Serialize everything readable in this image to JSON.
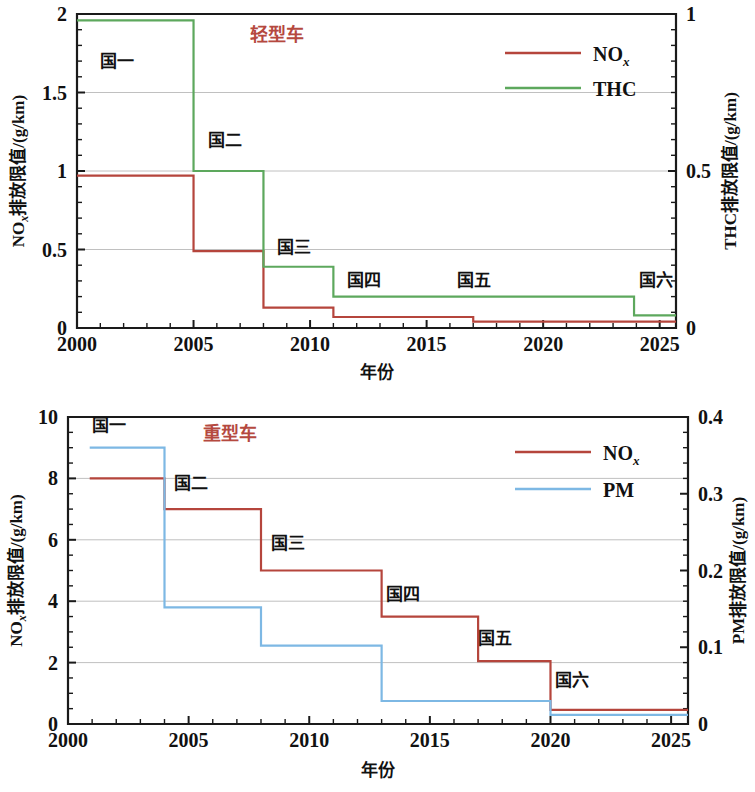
{
  "figure": {
    "panels": [
      {
        "id": "light-duty",
        "panel_title": "轻型车",
        "panel_title_color": "#b5493f",
        "x_axis_title": "年份",
        "y_left_title_main": "NO",
        "y_left_title_sub": "x",
        "y_left_title_rest": "排放限值/(g/km)",
        "y_right_title": "THC排放限值/(g/km)",
        "x_ticks": [
          "2000",
          "2005",
          "2010",
          "2015",
          "2020",
          "2025"
        ],
        "y_left_ticks": [
          "0",
          "0.5",
          "1",
          "1.5",
          "2"
        ],
        "y_right_ticks": [
          "0",
          "0.5",
          "1"
        ],
        "stage_labels": [
          {
            "text": "国一",
            "x": 2001.0,
            "y": 1.66
          },
          {
            "text": "国二",
            "x": 2005.6,
            "y": 1.16
          },
          {
            "text": "国三",
            "x": 2008.6,
            "y": 0.48
          },
          {
            "text": "国四",
            "x": 2011.6,
            "y": 0.27
          },
          {
            "text": "国五",
            "x": 2016.3,
            "y": 0.27
          },
          {
            "text": "国六",
            "x": 2024.1,
            "y": 0.27
          }
        ],
        "legend": [
          {
            "label": "NO",
            "sub": "x",
            "color": "#b5453c",
            "name": "nox"
          },
          {
            "label": "THC",
            "sub": "",
            "color": "#5da85d",
            "name": "thc"
          }
        ]
      },
      {
        "id": "heavy-duty",
        "panel_title": "重型车",
        "panel_title_color": "#b5493f",
        "x_axis_title": "年份",
        "y_left_title_main": "NO",
        "y_left_title_sub": "x",
        "y_left_title_rest": "排放限值/(g/km)",
        "y_right_title": "PM排放限值/(g/km)",
        "x_ticks": [
          "2000",
          "2005",
          "2010",
          "2015",
          "2020",
          "2025"
        ],
        "y_left_ticks": [
          "0",
          "2",
          "4",
          "6",
          "8",
          "10"
        ],
        "y_right_ticks": [
          "0",
          "0.1",
          "0.2",
          "0.3",
          "0.4"
        ],
        "stage_labels": [
          {
            "text": "国一",
            "x": 2001.0,
            "y": 9.55
          },
          {
            "text": "国二",
            "x": 2004.4,
            "y": 7.65
          },
          {
            "text": "国三",
            "x": 2008.4,
            "y": 5.7
          },
          {
            "text": "国四",
            "x": 2013.2,
            "y": 4.05
          },
          {
            "text": "国五",
            "x": 2017.0,
            "y": 2.6
          },
          {
            "text": "国六",
            "x": 2020.2,
            "y": 1.25
          }
        ],
        "legend": [
          {
            "label": "NO",
            "sub": "x",
            "color": "#b5453c",
            "name": "nox"
          },
          {
            "label": "PM",
            "sub": "",
            "color": "#7db8e4",
            "name": "pm"
          }
        ]
      }
    ]
  },
  "chart_data": [
    {
      "type": "line",
      "title": "轻型车",
      "subtitle": "Light-duty vehicle emission limits by China national stage",
      "xlabel": "年份",
      "ylabel": "NOx排放限值/(g/km)",
      "y2label": "THC排放限值/(g/km)",
      "xlim": [
        2000,
        2025.7
      ],
      "ylim": [
        0,
        2
      ],
      "y2lim": [
        0,
        1
      ],
      "xticks": [
        2000,
        2005,
        2010,
        2015,
        2020,
        2025
      ],
      "yticks": [
        0,
        0.5,
        1,
        1.5,
        2
      ],
      "y2ticks": [
        0,
        0.5,
        1
      ],
      "grid": "horizontal",
      "legend_position": "top-right",
      "step_style": "post",
      "annotations": [
        "国一",
        "国二",
        "国三",
        "国四",
        "国五",
        "国六"
      ],
      "series": [
        {
          "name": "NOx",
          "axis": "left",
          "color": "#b5453c",
          "x": [
            2000,
            2005,
            2008,
            2011,
            2017,
            2025.7
          ],
          "values": [
            0.97,
            0.49,
            0.13,
            0.07,
            0.04,
            0.04
          ],
          "stage_values": {
            "国一": 0.97,
            "国二": 0.49,
            "国三": 0.13,
            "国四": 0.07,
            "国五": 0.04,
            "国六": 0.04
          }
        },
        {
          "name": "THC",
          "axis": "right",
          "color": "#5da85d",
          "x": [
            2000,
            2005,
            2008,
            2011,
            2023.9,
            2025.7
          ],
          "values": [
            0.98,
            0.5,
            0.195,
            0.1,
            0.04,
            0.04
          ],
          "values_left_scale": [
            1.96,
            1.0,
            0.39,
            0.2,
            0.08,
            0.08
          ],
          "stage_values": {
            "国一": 0.98,
            "国二": 0.5,
            "国三": 0.195,
            "国四": 0.1,
            "国五": 0.1,
            "国六": 0.04
          }
        }
      ]
    },
    {
      "type": "line",
      "title": "重型车",
      "subtitle": "Heavy-duty vehicle emission limits by China national stage",
      "xlabel": "年份",
      "ylabel": "NOx排放限值/(g/km)",
      "y2label": "PM排放限值/(g/km)",
      "xlim": [
        2000,
        2025.7
      ],
      "ylim": [
        0,
        10
      ],
      "y2lim": [
        0,
        0.4
      ],
      "xticks": [
        2000,
        2005,
        2010,
        2015,
        2020,
        2025
      ],
      "yticks": [
        0,
        2,
        4,
        6,
        8,
        10
      ],
      "y2ticks": [
        0,
        0.1,
        0.2,
        0.3,
        0.4
      ],
      "grid": "horizontal",
      "legend_position": "top-right",
      "step_style": "post",
      "annotations": [
        "国一",
        "国二",
        "国三",
        "国四",
        "国五",
        "国六"
      ],
      "series": [
        {
          "name": "NOx",
          "axis": "left",
          "color": "#b5453c",
          "x": [
            2000.9,
            2004,
            2008,
            2013,
            2017,
            2020,
            2025.7
          ],
          "values": [
            8.0,
            7.0,
            5.0,
            3.5,
            2.05,
            0.46,
            0.46
          ],
          "stage_values": {
            "国一": 8.0,
            "国二": 7.0,
            "国三": 5.0,
            "国四": 3.5,
            "国五": 2.05,
            "国六": 0.46
          }
        },
        {
          "name": "PM",
          "axis": "right",
          "color": "#7db8e4",
          "x": [
            2000.9,
            2004,
            2008,
            2013,
            2020,
            2025.7
          ],
          "values": [
            0.36,
            0.152,
            0.102,
            0.03,
            0.012,
            0.012
          ],
          "values_left_scale": [
            9.0,
            3.8,
            2.55,
            0.75,
            0.3,
            0.3
          ],
          "stage_values": {
            "国一": 0.36,
            "国二": 0.152,
            "国三": 0.102,
            "国四": 0.03,
            "国五": 0.03,
            "国六": 0.012
          }
        }
      ]
    }
  ]
}
